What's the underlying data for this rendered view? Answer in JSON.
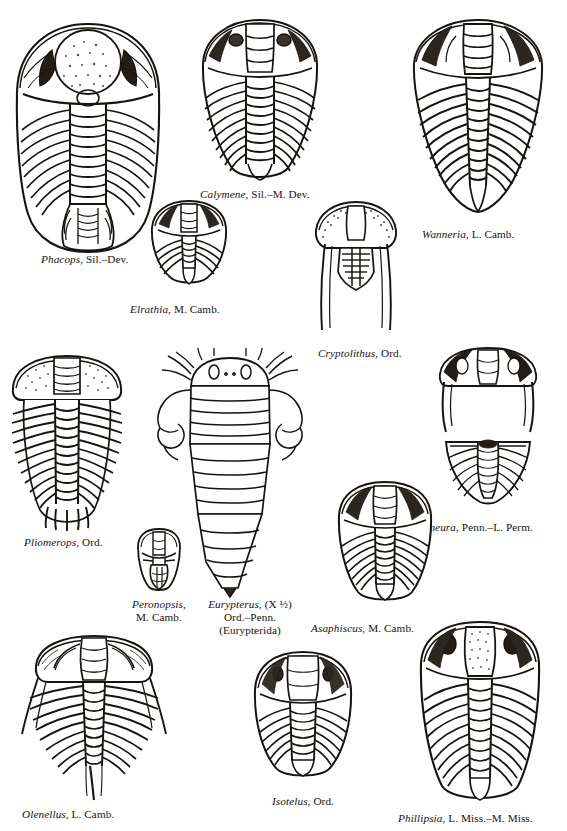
{
  "plate": {
    "title": "Trilobite and eurypterid genera plate",
    "background_color": "#fefefe",
    "ink_color": "#17140f",
    "figure_count": 12
  },
  "specimens": [
    {
      "id": "phacops",
      "genus": "Phacops",
      "age": "Sil.–Dev.",
      "caption": "Phacops, Sil.–Dev.",
      "kind": "trilobite",
      "view": "dorsal complete",
      "label_align": "left"
    },
    {
      "id": "calymene",
      "genus": "Calymene",
      "age": "Sil.–M. Dev.",
      "caption": "Calymene, Sil.–M. Dev.",
      "kind": "trilobite",
      "view": "dorsal complete",
      "label_align": "left"
    },
    {
      "id": "wanneria",
      "genus": "Wanneria",
      "age": "L. Camb.",
      "caption": "Wanneria, L. Camb.",
      "kind": "trilobite",
      "view": "dorsal complete",
      "label_align": "left"
    },
    {
      "id": "elrathia",
      "genus": "Elrathia",
      "age": "M. Camb.",
      "caption": "Elrathia, M. Camb.",
      "kind": "trilobite",
      "view": "dorsal complete",
      "label_align": "left"
    },
    {
      "id": "cryptolithus",
      "genus": "Cryptolithus",
      "age": "Ord.",
      "caption": "Cryptolithus, Ord.",
      "kind": "trilobite",
      "view": "dorsal with genal spines",
      "label_align": "left"
    },
    {
      "id": "pliomerops",
      "genus": "Pliomerops",
      "age": "Ord.",
      "caption": "Pliomerops, Ord.",
      "kind": "trilobite",
      "view": "dorsal complete",
      "label_align": "left"
    },
    {
      "id": "peronopsis",
      "genus": "Peronopsis",
      "age": "M. Camb.",
      "caption_lines": [
        "Peronopsis,",
        "M. Camb."
      ],
      "kind": "trilobite",
      "view": "dorsal complete small",
      "label_align": "center"
    },
    {
      "id": "eurypterus",
      "genus": "Eurypterus",
      "magnification": "(X ½)",
      "age": "Ord.–Penn.",
      "group": "(Eurypterida)",
      "caption_lines": [
        "Eurypterus, (X ½)",
        "Ord.–Penn.",
        "(Eurypterida)"
      ],
      "kind": "eurypterid",
      "view": "dorsal complete",
      "label_align": "center"
    },
    {
      "id": "ameura",
      "genus": "Ameura",
      "age": "Penn.–L. Perm.",
      "caption": "Ameura, Penn.–L. Perm.",
      "kind": "trilobite",
      "view": "cephalon and pygidium",
      "label_align": "left"
    },
    {
      "id": "asaphiscus",
      "genus": "Asaphiscus",
      "age": "M. Camb.",
      "caption": "Asaphiscus, M. Camb.",
      "kind": "trilobite",
      "view": "dorsal complete",
      "label_align": "left"
    },
    {
      "id": "olenellus",
      "genus": "Olenellus",
      "age": "L. Camb.",
      "caption": "Olenellus, L. Camb.",
      "kind": "trilobite",
      "view": "dorsal complete spiny",
      "label_align": "left"
    },
    {
      "id": "isotelus",
      "genus": "Isotelus",
      "age": "Ord.",
      "caption": "Isotelus, Ord.",
      "kind": "trilobite",
      "view": "dorsal complete",
      "label_align": "center"
    },
    {
      "id": "phillipsia",
      "genus": "Phillipsia",
      "age": "L. Miss.–M. Miss.",
      "caption": "Phillipsia, L. Miss.–M. Miss.",
      "kind": "trilobite",
      "view": "dorsal complete",
      "label_align": "left"
    }
  ]
}
